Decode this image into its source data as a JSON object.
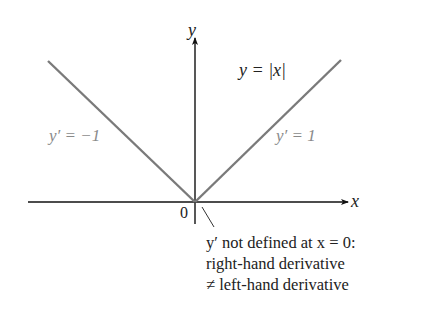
{
  "figure": {
    "function_label": "y = |x|",
    "axis_x_label": "x",
    "axis_y_label": "y",
    "origin_label": "0",
    "left_slope_label": "y′ = −1",
    "right_slope_label": "y′ = 1",
    "annotation": {
      "line1": "y′ not defined at x = 0:",
      "line2": "right-hand derivative",
      "line3": "≠ left-hand derivative"
    },
    "colors": {
      "axes": "#111111",
      "graph": "#7a7a7a",
      "slope_text": "#8a8a8a",
      "text": "#222222"
    }
  }
}
